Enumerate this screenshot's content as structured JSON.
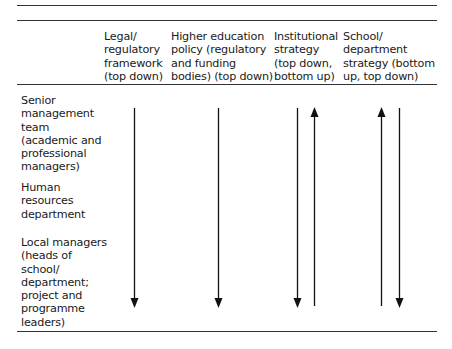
{
  "table": {
    "columns": [
      {
        "label": "Legal/\nregulatory\nframework\n(top down)",
        "direction": "down"
      },
      {
        "label": "Higher education\npolicy (regulatory\nand funding\nbodies) (top down)",
        "direction": "down"
      },
      {
        "label": "Institutional\nstrategy\n(top down,\nbottom up)",
        "direction": "down,up"
      },
      {
        "label": "School/\ndepartment\nstrategy (bottom\nup, top down)",
        "direction": "up,down"
      }
    ],
    "rows": [
      {
        "label": "Senior\nmanagement\nteam\n(academic and\nprofessional\nmanagers)"
      },
      {
        "label": "Human\nresources\ndepartment"
      },
      {
        "label": "Local managers\n(heads of\nschool/\ndepartment;\nproject and\nprogramme\nleaders)"
      }
    ]
  }
}
